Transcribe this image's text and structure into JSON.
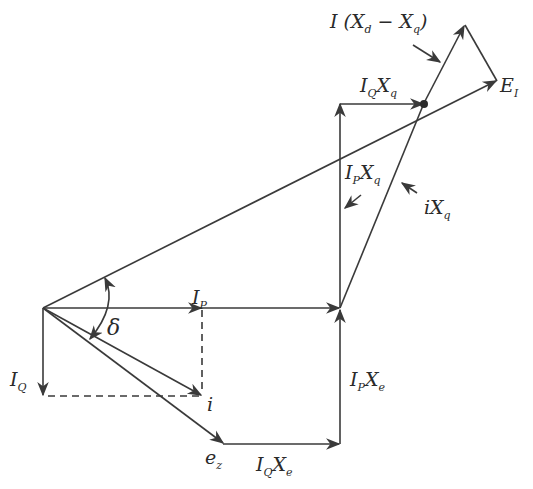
{
  "diagram": {
    "labels": {
      "delta": "δ",
      "ip": {
        "main": "I",
        "sub": "P"
      },
      "iq": {
        "main": "I",
        "sub": "Q"
      },
      "i": "i",
      "ez": {
        "main": "e",
        "sub": "z"
      },
      "iqxe": {
        "m1": "I",
        "s1": "Q",
        "m2": "X",
        "s2": "e"
      },
      "ipxe": {
        "m1": "I",
        "s1": "P",
        "m2": "X",
        "s2": "e"
      },
      "ipxq": {
        "m1": "I",
        "s1": "P",
        "m2": "X",
        "s2": "q"
      },
      "ixq": {
        "m1": "iX",
        "s1": "q"
      },
      "iqxq": {
        "m1": "I",
        "s1": "Q",
        "m2": "X",
        "s2": "q"
      },
      "ei": {
        "main": "E",
        "sub": "I"
      },
      "ixdxq": {
        "pre": "I (X",
        "s1": "d",
        "mid": " − X",
        "s2": "q",
        "post": ")"
      }
    },
    "colors": {
      "line": "#3a3a3a",
      "background": "#ffffff"
    }
  }
}
